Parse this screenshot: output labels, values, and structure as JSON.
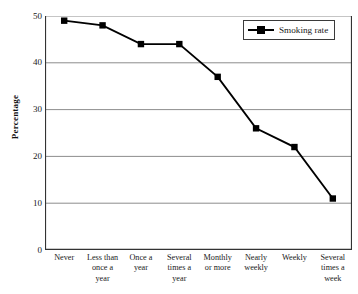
{
  "chart_data": {
    "type": "line",
    "title": "",
    "xlabel": "",
    "ylabel": "Percentage",
    "ylim": [
      0,
      50
    ],
    "ytick_values": [
      0,
      10,
      20,
      30,
      40,
      50
    ],
    "ytick_labels": [
      "0",
      "10",
      "20",
      "30",
      "40",
      "50"
    ],
    "grid": "horizontal",
    "legend_position": "top-right",
    "categories": [
      "Never",
      "Less than once a year",
      "Once a year",
      "Several times a year",
      "Monthly or more",
      "Nearly weekly",
      "Weekly",
      "Several times a week"
    ],
    "series": [
      {
        "name": "Smoking rate",
        "color": "#000000",
        "marker": "square",
        "values": [
          49,
          48,
          44,
          44,
          37,
          26,
          22,
          11
        ]
      }
    ]
  },
  "axes": {
    "y_title": "Percentage",
    "y_ticks": [
      "50",
      "40",
      "30",
      "20",
      "10",
      "0"
    ],
    "x_ticks": [
      "Never",
      "Less than once a year",
      "Once a year",
      "Several times a year",
      "Monthly or more",
      "Nearly weekly",
      "Weekly",
      "Several times a week"
    ]
  },
  "legend": {
    "entries": [
      {
        "label": "Smoking rate",
        "color": "#000000",
        "marker": "square-marker"
      }
    ]
  },
  "style": {
    "line_color": "#000000",
    "marker_color": "#000000",
    "grid_color": "#808080",
    "axis_color": "#333333",
    "background": "#ffffff"
  }
}
